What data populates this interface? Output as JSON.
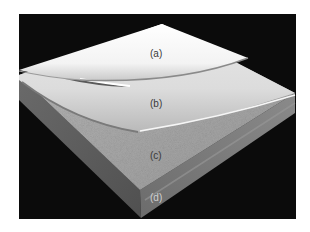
{
  "figure": {
    "background_color": "#0a0a0a",
    "labels": {
      "a": "(a)",
      "b": "(b)",
      "c": "(c)",
      "d": "(d)"
    },
    "layers": [
      {
        "id": "a",
        "name": "top sheet",
        "color": "#f4f4f4"
      },
      {
        "id": "b",
        "name": "second sheet",
        "color": "#d8d8d8"
      },
      {
        "id": "c",
        "name": "textured surface",
        "color": "#a9a9a9"
      },
      {
        "id": "d",
        "name": "base slab side",
        "color": "#6e6e6e"
      }
    ]
  }
}
